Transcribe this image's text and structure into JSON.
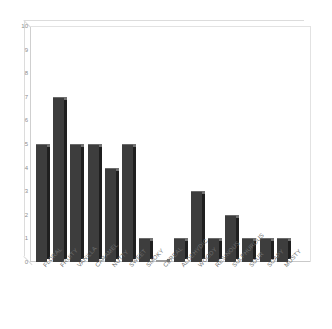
{
  "chart_data": {
    "type": "bar",
    "title": "",
    "subtitle": "",
    "xlabel": "",
    "ylabel": "",
    "ylim": [
      0,
      10
    ],
    "yticks": [
      0,
      1,
      2,
      3,
      4,
      5,
      6,
      7,
      8,
      9,
      10
    ],
    "grid": false,
    "legend": false,
    "legend_position": "none",
    "style": "3d-bar",
    "bar_color": "#3d3d3d",
    "bar_side_color": "#1f1f1f",
    "bar_top_color": "#727272",
    "background_color": "#ffffff",
    "axis_color": "#cfcfcf",
    "tick_label_color": "#8d8d8d",
    "categories": [
      "FLORAL",
      "FRUITY",
      "VANILLA",
      "CARAMEL",
      "NUTTY",
      "SWEET",
      "SMOKY",
      "CEREAL",
      "ALDEHYDIC",
      "WOODY",
      "RESINOUS",
      "SULPHUROUS",
      "SOUR",
      "SOAPY",
      "MUSTY"
    ],
    "values": [
      5,
      7,
      5,
      5,
      4,
      5,
      1,
      0,
      1,
      3,
      1,
      2,
      1,
      1,
      1
    ]
  }
}
